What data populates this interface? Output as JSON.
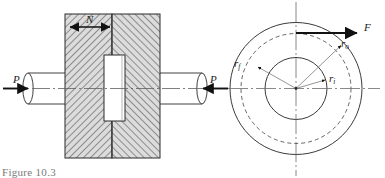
{
  "figure": {
    "caption": "Figure 10.3",
    "left_view": {
      "name": "sectional-side-view",
      "labels": {
        "normal_force": "N",
        "load_left": "P",
        "load_right": "P"
      },
      "hatch_color": "#3c3c3c",
      "block_fill": "#d8d8d8",
      "outline_color": "#2b2b2b"
    },
    "right_view": {
      "name": "end-view-circles",
      "labels": {
        "friction_force": "F",
        "outer_radius": "r",
        "outer_radius_sub": "o",
        "friction_radius": "r",
        "friction_radius_sub": "f",
        "inner_radius": "r",
        "inner_radius_sub": "i"
      },
      "circle_color": "#3a3a3a",
      "centerline_color": "#6b6b6b"
    }
  }
}
